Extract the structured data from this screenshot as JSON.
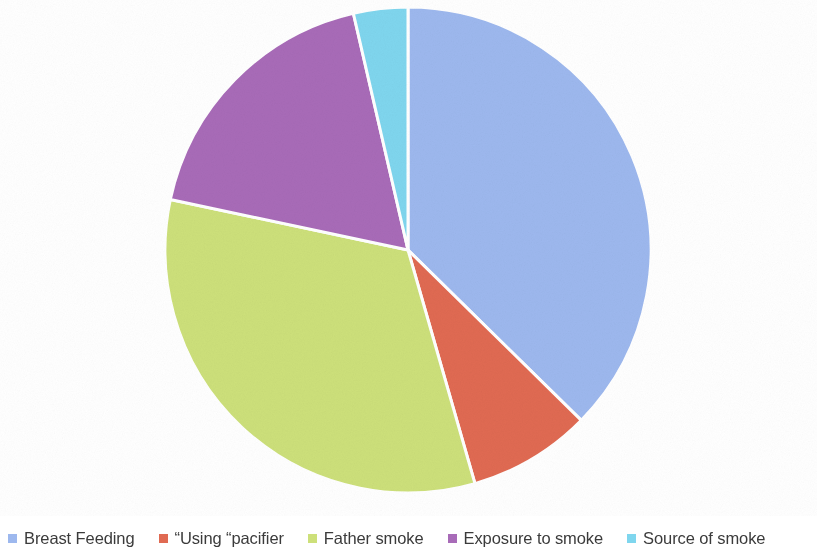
{
  "chart_data": {
    "type": "pie",
    "title": "",
    "legend_position": "bottom",
    "start_angle_deg": 0,
    "direction": "clockwise",
    "categories": [
      "Breast Feeding",
      "“Using “pacifier",
      "Father smoke",
      "Exposure to smoke",
      "Source of smoke"
    ],
    "values": [
      37.4,
      8.2,
      32.8,
      18.1,
      3.5
    ],
    "unit": "percent",
    "colors": [
      "#9DB8EE",
      "#E06A52",
      "#CDE07A",
      "#A86BB8",
      "#7FD6EE"
    ],
    "slices": [
      {
        "label": "Breast Feeding",
        "value": 37.4,
        "color": "#9DB8EE",
        "start_deg": 0.0,
        "end_deg": 134.5
      },
      {
        "label": "“Using “pacifier",
        "value": 8.2,
        "color": "#E06A52",
        "start_deg": 134.5,
        "end_deg": 164.0
      },
      {
        "label": "Father smoke",
        "value": 32.8,
        "color": "#CDE07A",
        "start_deg": 164.0,
        "end_deg": 282.0
      },
      {
        "label": "Exposure to smoke",
        "value": 18.1,
        "color": "#A86BB8",
        "start_deg": 282.0,
        "end_deg": 347.0
      },
      {
        "label": "Source of smoke",
        "value": 3.5,
        "color": "#7FD6EE",
        "start_deg": 347.0,
        "end_deg": 360.0
      }
    ]
  },
  "legend": {
    "items": [
      {
        "label": "Breast Feeding",
        "color": "#9DB8EE"
      },
      {
        "label": "“Using “pacifier",
        "color": "#E06A52"
      },
      {
        "label": "Father smoke",
        "color": "#CDE07A"
      },
      {
        "label": "Exposure to smoke",
        "color": "#A86BB8"
      },
      {
        "label": "Source of smoke",
        "color": "#7FD6EE"
      }
    ]
  },
  "geometry": {
    "center_x": 408,
    "center_y": 250,
    "radius": 243,
    "separator_color": "#ffffff",
    "separator_width": 3
  },
  "background": {
    "color": "#ffffff"
  }
}
